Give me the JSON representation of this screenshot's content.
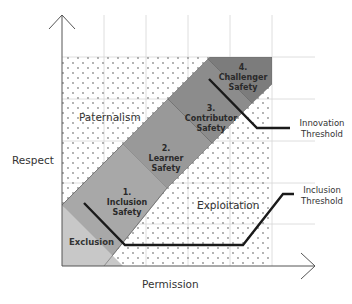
{
  "axes": {
    "x_label": "Permission",
    "y_label": "Respect"
  },
  "regions": {
    "paternalism": "Paternalism",
    "exploitation": "Exploitation",
    "exclusion": "Exclusion"
  },
  "stages": [
    {
      "number": "1.",
      "line1": "Inclusion",
      "line2": "Safety",
      "color": "#a6a6a6"
    },
    {
      "number": "2.",
      "line1": "Learner",
      "line2": "Safety",
      "color": "#989898"
    },
    {
      "number": "3.",
      "line1": "Contributor",
      "line2": "Safety",
      "color": "#8a8a8a"
    },
    {
      "number": "4.",
      "line1": "Challenger",
      "line2": "Safety",
      "color": "#7a7a7a"
    }
  ],
  "thresholds": {
    "innovation": {
      "line1": "Innovation",
      "line2": "Threshold"
    },
    "inclusion": {
      "line1": "Inclusion",
      "line2": "Threshold"
    }
  },
  "colors": {
    "exclusion_fill": "#c8c8c8",
    "dot": "#8f8f8f",
    "grid": "#cfcfcf",
    "threshold_line": "#1a1a1a",
    "axis": "#555555"
  }
}
